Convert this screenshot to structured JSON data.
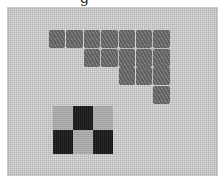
{
  "caption_fragment": "g",
  "photo": {
    "subject": "embroidered stitch sample on canvas",
    "colors": {
      "canvas": "#c9c9c9",
      "mid_gray": "#6e6e6e",
      "dark": "#1c1c1c",
      "light": "#a9a9a9"
    },
    "staircase_group": {
      "rows": [
        {
          "count": 7,
          "start_col": 0
        },
        {
          "count": 5,
          "start_col": 2
        },
        {
          "count": 3,
          "start_col": 4
        },
        {
          "count": 1,
          "start_col": 6
        }
      ]
    },
    "checker_group": {
      "rows": [
        [
          "light",
          "dark",
          "light"
        ],
        [
          "dark",
          "light",
          "dark"
        ]
      ]
    }
  }
}
